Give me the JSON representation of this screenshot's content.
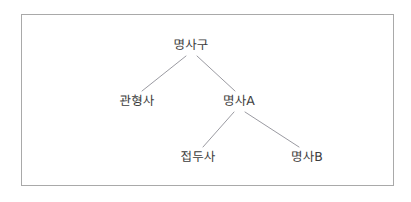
{
  "figure": {
    "kind": "syntax-tree-diagram",
    "border_color": "#a9a9a9",
    "text_color": "#3c3c3c",
    "edge_color": "#8f8f96",
    "background_color": "#ffffff",
    "nodes": [
      {
        "id": "np",
        "label": "명사구",
        "x": 191,
        "y": 45,
        "level": 0,
        "role": "root"
      },
      {
        "id": "det",
        "label": "관형사",
        "x": 137,
        "y": 101,
        "level": 1,
        "role": "leaf"
      },
      {
        "id": "noun_a",
        "label": "명사A",
        "x": 239,
        "y": 101,
        "level": 1,
        "role": "branch"
      },
      {
        "id": "prefix",
        "label": "접두사",
        "x": 198,
        "y": 157,
        "level": 2,
        "role": "leaf"
      },
      {
        "id": "noun_b",
        "label": "명사B",
        "x": 307,
        "y": 157,
        "level": 2,
        "role": "leaf"
      }
    ],
    "edges": [
      {
        "from": "np",
        "to": "det",
        "x1": 186,
        "y1": 56,
        "x2": 142,
        "y2": 91
      },
      {
        "from": "np",
        "to": "noun_a",
        "x1": 197,
        "y1": 56,
        "x2": 235,
        "y2": 91
      },
      {
        "from": "noun_a",
        "to": "prefix",
        "x1": 234,
        "y1": 112,
        "x2": 203,
        "y2": 147
      },
      {
        "from": "noun_a",
        "to": "noun_b",
        "x1": 245,
        "y1": 112,
        "x2": 299,
        "y2": 147
      }
    ]
  }
}
